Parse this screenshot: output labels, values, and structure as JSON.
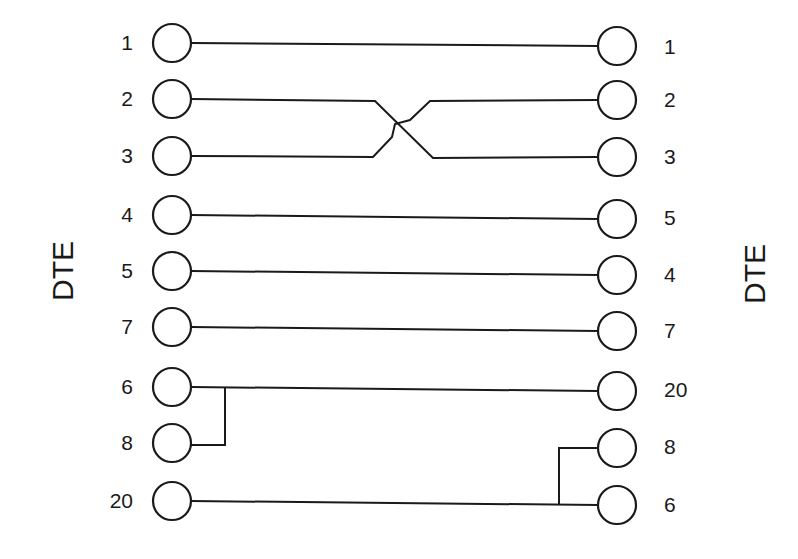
{
  "diagram": {
    "type": "null-modem-wiring",
    "left_side": {
      "label": "DTE",
      "pins": [
        "1",
        "2",
        "3",
        "4",
        "5",
        "7",
        "6",
        "8",
        "20"
      ]
    },
    "right_side": {
      "label": "DTE",
      "pins": [
        "1",
        "2",
        "3",
        "5",
        "4",
        "7",
        "20",
        "8",
        "6"
      ]
    },
    "connections": [
      {
        "from": "1",
        "to": "1"
      },
      {
        "from": "2",
        "to": "3",
        "crossed": true
      },
      {
        "from": "3",
        "to": "2",
        "crossed": true
      },
      {
        "from": "4",
        "to": "5"
      },
      {
        "from": "5",
        "to": "4"
      },
      {
        "from": "7",
        "to": "7"
      },
      {
        "from": "6+8",
        "to": "20",
        "note": "left pins 6 and 8 bridged"
      },
      {
        "from": "20",
        "to": "8+6",
        "note": "right pins 8 and 6 bridged"
      }
    ],
    "colors": {
      "line": "#1a1a1a",
      "background": "#ffffff"
    }
  }
}
